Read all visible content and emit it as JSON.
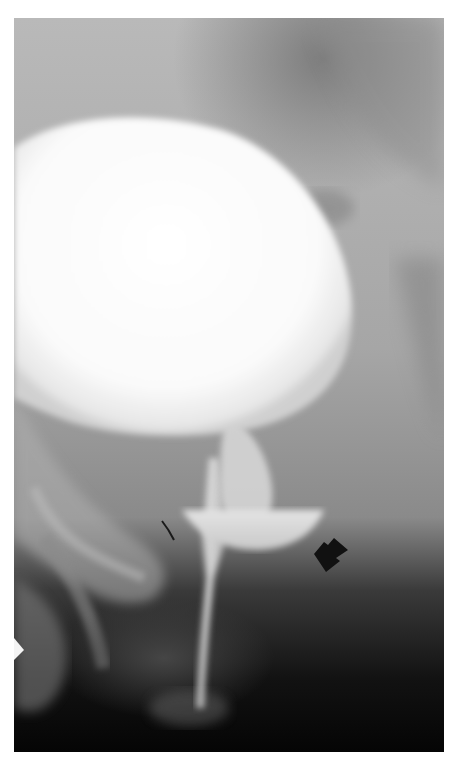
{
  "image": {
    "kind": "radiograph",
    "modality": "voiding cystourethrogram (grayscale x-ray)",
    "alt": "Grayscale x-ray showing a large contrast-filled bladder with a narrow urethral channel below it and a crescent-shaped contrast collection indicated by a black arrow",
    "annotations": [
      {
        "type": "arrow",
        "color": "#111111",
        "direction": "pointing up-left",
        "target": "crescent-shaped contrast collection"
      },
      {
        "type": "arrowhead-marker",
        "color": "#ffffff",
        "location": "left edge, lower third"
      }
    ],
    "palette": {
      "background": "#ffffff",
      "film_mid": "#9a9a9a",
      "bladder": "#fbfbfb",
      "dark_base": "#0a0a0a"
    }
  }
}
